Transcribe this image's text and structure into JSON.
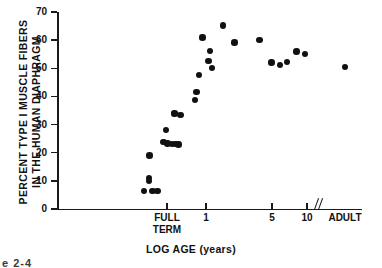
{
  "figure": {
    "caption_fragment": "e 2-4"
  },
  "chart_data": {
    "type": "scatter",
    "title": "",
    "xlabel": "LOG AGE (years)",
    "ylabel_line1": "PERCENT TYPE I MUSCLE FIBERS",
    "ylabel_line2": "IN THE HUMAN DIAPHRAGM",
    "ylim": [
      0,
      70
    ],
    "yticks": [
      0,
      10,
      20,
      30,
      40,
      50,
      60,
      70
    ],
    "ytick_labels": [
      "0",
      "10",
      "20",
      "30",
      "40",
      "50",
      "60",
      "70"
    ],
    "xticks": [
      167,
      206,
      272,
      307
    ],
    "xtick_labels": [
      "FULL TERM",
      "1",
      "5",
      "10",
      "ADULT"
    ],
    "xtick_label_lines": [
      [
        "FULL",
        "TERM"
      ],
      [
        "1"
      ],
      [
        "5"
      ],
      [
        "10"
      ],
      [
        "ADULT"
      ]
    ],
    "x_axis_scale": "log",
    "x_axis_break_after": "10",
    "grid": false,
    "legend": null,
    "marker": "filled-circle",
    "marker_color": "#111111",
    "points": [
      {
        "px": 144.0,
        "y": 6.5
      },
      {
        "px": 152.5,
        "y": 6.5
      },
      {
        "px": 157.5,
        "y": 6.5
      },
      {
        "px": 149.0,
        "y": 10.0
      },
      {
        "px": 149.0,
        "y": 11.0
      },
      {
        "px": 149.5,
        "y": 19.0
      },
      {
        "px": 163.5,
        "y": 23.8
      },
      {
        "px": 167.5,
        "y": 23.3
      },
      {
        "px": 172.0,
        "y": 23.2
      },
      {
        "px": 175.5,
        "y": 23.0
      },
      {
        "px": 178.5,
        "y": 22.9
      },
      {
        "px": 166.0,
        "y": 28.1
      },
      {
        "px": 174.5,
        "y": 33.8
      },
      {
        "px": 174.5,
        "y": 34.2
      },
      {
        "px": 180.5,
        "y": 33.3
      },
      {
        "px": 195.0,
        "y": 38.7
      },
      {
        "px": 196.5,
        "y": 41.6
      },
      {
        "px": 199.0,
        "y": 47.7
      },
      {
        "px": 212.0,
        "y": 50.1
      },
      {
        "px": 208.5,
        "y": 52.6
      },
      {
        "px": 210.0,
        "y": 56.2
      },
      {
        "px": 202.5,
        "y": 61.0
      },
      {
        "px": 223.0,
        "y": 65.2
      },
      {
        "px": 234.5,
        "y": 59.1
      },
      {
        "px": 259.5,
        "y": 60.1
      },
      {
        "px": 271.5,
        "y": 52.1
      },
      {
        "px": 280.0,
        "y": 51.1
      },
      {
        "px": 287.0,
        "y": 52.3
      },
      {
        "px": 296.5,
        "y": 55.9
      },
      {
        "px": 305.0,
        "y": 55.0
      },
      {
        "px": 345.0,
        "y": 50.5
      }
    ]
  },
  "axis_geometry": {
    "plot_left_px": 57,
    "plot_top_px": 12,
    "plot_bottom_px": 209,
    "plot_right_px": 362
  }
}
